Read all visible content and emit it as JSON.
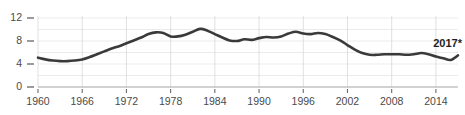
{
  "chart_data": {
    "type": "line",
    "title": "",
    "subtitle": "",
    "xlabel": "",
    "ylabel": "",
    "xlim": [
      1960,
      2017
    ],
    "ylim": [
      0,
      12
    ],
    "grid": true,
    "legend": "none",
    "y_ticks": [
      "0",
      "4",
      "8",
      "12"
    ],
    "y_tick_values": [
      0,
      4,
      8,
      12
    ],
    "y_gridline_values": [
      2,
      4,
      6,
      8,
      10,
      12
    ],
    "x_ticks": [
      "1960",
      "1966",
      "1972",
      "1978",
      "1984",
      "1990",
      "1996",
      "2002",
      "2008",
      "2014"
    ],
    "x_tick_values": [
      1960,
      1966,
      1972,
      1978,
      1984,
      1990,
      1996,
      2002,
      2008,
      2014
    ],
    "series": [
      {
        "name": "series-1",
        "color": "#3a3a3a",
        "x": [
          1960,
          1961,
          1962,
          1963,
          1964,
          1965,
          1966,
          1967,
          1968,
          1969,
          1970,
          1971,
          1972,
          1973,
          1974,
          1975,
          1976,
          1977,
          1978,
          1979,
          1980,
          1981,
          1982,
          1983,
          1984,
          1985,
          1986,
          1987,
          1988,
          1989,
          1990,
          1991,
          1992,
          1993,
          1994,
          1995,
          1996,
          1997,
          1998,
          1999,
          2000,
          2001,
          2002,
          2003,
          2004,
          2005,
          2006,
          2007,
          2008,
          2009,
          2010,
          2011,
          2012,
          2013,
          2014,
          2015,
          2016,
          2017
        ],
        "values": [
          5.1,
          4.8,
          4.6,
          4.5,
          4.5,
          4.6,
          4.8,
          5.2,
          5.7,
          6.2,
          6.7,
          7.1,
          7.6,
          8.1,
          8.6,
          9.2,
          9.5,
          9.4,
          8.8,
          8.8,
          9.1,
          9.6,
          10.1,
          9.8,
          9.2,
          8.6,
          8.1,
          8.0,
          8.3,
          8.2,
          8.5,
          8.7,
          8.6,
          8.8,
          9.3,
          9.6,
          9.3,
          9.2,
          9.4,
          9.2,
          8.7,
          8.1,
          7.3,
          6.5,
          5.9,
          5.6,
          5.6,
          5.7,
          5.7,
          5.7,
          5.6,
          5.7,
          5.9,
          5.7,
          5.3,
          5.0,
          4.7,
          5.5
        ]
      }
    ],
    "annotations": [
      {
        "name": "endpoint-label",
        "text": "2017*",
        "x": 2017,
        "y": 6.9,
        "bold": true
      }
    ]
  }
}
